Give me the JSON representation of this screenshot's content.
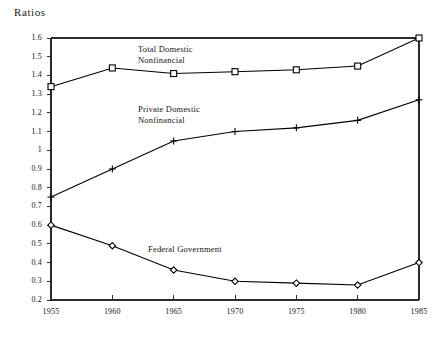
{
  "chart_data": {
    "type": "line",
    "title": "Ratios",
    "xlabel": "",
    "ylabel": "Ratios",
    "x": [
      1955,
      1960,
      1965,
      1970,
      1975,
      1980,
      1985
    ],
    "xtick_labels": [
      "1955",
      "1960",
      "1965",
      "1970",
      "1975",
      "1980",
      "1985"
    ],
    "xlim": [
      1955,
      1985
    ],
    "ylim": [
      0.2,
      1.6
    ],
    "ytick_values": [
      0.2,
      0.3,
      0.4,
      0.5,
      0.6,
      0.7,
      0.8,
      0.9,
      1.0,
      1.1,
      1.2,
      1.3,
      1.4,
      1.5,
      1.6
    ],
    "ytick_labels": [
      "0.2",
      "0.3",
      "0.4",
      "0.5",
      "0.6",
      "0.7",
      "0.8",
      "0.9",
      "1",
      "1.1",
      "1.2",
      "1.3",
      "1.4",
      "1.5",
      "1.6"
    ],
    "grid": false,
    "legend_position": "inline-annotations",
    "series": [
      {
        "name": "Total Domestic Nonfinancial",
        "marker": "square",
        "color": "#000000",
        "values": [
          1.34,
          1.44,
          1.41,
          1.42,
          1.43,
          1.45,
          1.6
        ]
      },
      {
        "name": "Private Domestic Nonfinancial",
        "marker": "plus",
        "color": "#000000",
        "values": [
          0.75,
          0.9,
          1.05,
          1.1,
          1.12,
          1.16,
          1.27
        ]
      },
      {
        "name": "Federal Government",
        "marker": "diamond",
        "color": "#000000",
        "values": [
          0.6,
          0.49,
          0.36,
          0.3,
          0.29,
          0.28,
          0.4
        ]
      }
    ],
    "annotations": [
      {
        "id": "total",
        "line1": "Total Domestic",
        "line2": "Nonfinancial"
      },
      {
        "id": "private",
        "line1": "Private Domestic",
        "line2": "Nonfinancial"
      },
      {
        "id": "federal",
        "line1": "Federal Government",
        "line2": ""
      }
    ]
  }
}
